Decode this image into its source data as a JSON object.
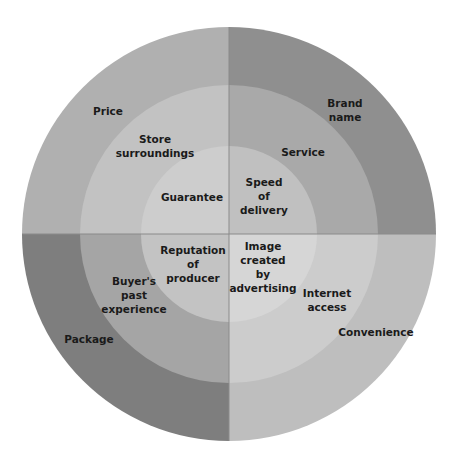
{
  "diagram": {
    "type": "concentric-quadrant-wheel",
    "center": {
      "x": 229,
      "y": 234
    },
    "radii": {
      "outer": 207,
      "middle": 149,
      "inner": 88
    },
    "background_ghost_text": [
      "unknown",
      "unknown"
    ],
    "quadrants": [
      {
        "id": "top-left",
        "colors": {
          "outer": "#b0b0b0",
          "middle": "#c2c2c2",
          "inner": "#cdcdcd"
        },
        "labels": {
          "outer": "Price",
          "middle": "Store\nsurroundings",
          "inner": "Guarantee"
        }
      },
      {
        "id": "top-right",
        "colors": {
          "outer": "#8f8f8f",
          "middle": "#a9a9a9",
          "inner": "#c0c0c0"
        },
        "labels": {
          "outer": "Brand\nname",
          "middle": "Service",
          "inner": "Speed\nof\ndelivery"
        }
      },
      {
        "id": "bottom-left",
        "colors": {
          "outer": "#7e7e7e",
          "middle": "#a5a5a5",
          "inner": "#c3c3c3"
        },
        "labels": {
          "outer": "Package",
          "middle": "Buyer's\npast\nexperience",
          "inner": "Reputation\nof\nproducer"
        }
      },
      {
        "id": "bottom-right",
        "colors": {
          "outer": "#bebebe",
          "middle": "#cccccc",
          "inner": "#d6d6d6"
        },
        "labels": {
          "outer": "Convenience",
          "middle": "Internet\naccess",
          "inner": "Image\ncreated\nby\nadvertising"
        }
      }
    ],
    "divider_color": "#8a8a8a"
  }
}
